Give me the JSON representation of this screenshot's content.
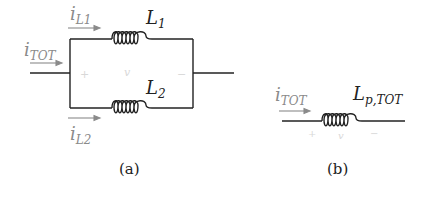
{
  "figure_a": {
    "caption": "(a)",
    "current_total": {
      "main": "i",
      "sub": "TOT"
    },
    "current_L1": {
      "main": "i",
      "sub": "L1"
    },
    "current_L2": {
      "main": "i",
      "sub": "L2"
    },
    "inductor_1": {
      "main": "L",
      "sub": "1"
    },
    "inductor_2": {
      "main": "L",
      "sub": "2"
    },
    "voltage_plus": "+",
    "voltage_label": "v",
    "voltage_minus": "−"
  },
  "figure_b": {
    "caption": "(b)",
    "current_total": {
      "main": "i",
      "sub": "TOT"
    },
    "inductor": {
      "main": "L",
      "sub": "p,TOT"
    },
    "voltage_plus": "+",
    "voltage_label": "v",
    "voltage_minus": "−"
  },
  "colors": {
    "wire": "#222222",
    "current_label": "#8a8a8a",
    "voltage_label": "#d8d8d8"
  }
}
